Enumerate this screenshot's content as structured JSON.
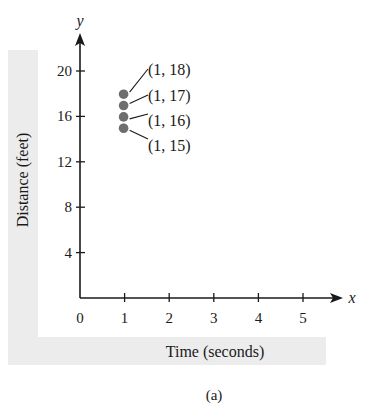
{
  "chart_data": {
    "type": "scatter",
    "title": "",
    "xlabel": "Time (seconds)",
    "ylabel": "Distance (feet)",
    "x_axis_letter": "x",
    "y_axis_letter": "y",
    "xlim": [
      0,
      5.8
    ],
    "ylim": [
      0,
      22
    ],
    "x_ticks": [
      1,
      2,
      3,
      4,
      5
    ],
    "x_tick_labels": [
      "0",
      "1",
      "2",
      "3",
      "4",
      "5"
    ],
    "y_ticks": [
      4,
      8,
      12,
      16,
      20
    ],
    "y_tick_labels": [
      "4",
      "8",
      "12",
      "16",
      "20"
    ],
    "grid": false,
    "legend": null,
    "series": [
      {
        "name": "points",
        "color": "#6e6e6e",
        "points": [
          {
            "x": 1,
            "y": 18,
            "label": "(1, 18)"
          },
          {
            "x": 1,
            "y": 17,
            "label": "(1, 17)"
          },
          {
            "x": 1,
            "y": 16,
            "label": "(1, 16)"
          },
          {
            "x": 1,
            "y": 15,
            "label": "(1, 15)"
          }
        ]
      }
    ],
    "caption": "(a)"
  },
  "colors": {
    "axis": "#1a1a1a",
    "point": "#6e6e6e",
    "band": "#ececec"
  }
}
